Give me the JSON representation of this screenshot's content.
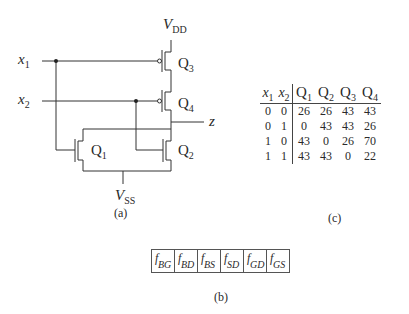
{
  "circuit": {
    "supply_top": {
      "main": "V",
      "sub": "DD"
    },
    "supply_bottom": {
      "main": "V",
      "sub": "SS"
    },
    "inputs": [
      {
        "main": "x",
        "sub": "1"
      },
      {
        "main": "x",
        "sub": "2"
      }
    ],
    "output": "z",
    "transistors": [
      {
        "main": "Q",
        "sub": "1",
        "type": "nMOS"
      },
      {
        "main": "Q",
        "sub": "2",
        "type": "nMOS"
      },
      {
        "main": "Q",
        "sub": "3",
        "type": "pMOS"
      },
      {
        "main": "Q",
        "sub": "4",
        "type": "pMOS"
      }
    ],
    "caption": "(a)"
  },
  "fault_vector": {
    "cells": [
      {
        "main": "f",
        "sub": "BG"
      },
      {
        "main": "f",
        "sub": "BD"
      },
      {
        "main": "f",
        "sub": "BS"
      },
      {
        "main": "f",
        "sub": "SD"
      },
      {
        "main": "f",
        "sub": "GD"
      },
      {
        "main": "f",
        "sub": "GS"
      }
    ],
    "caption": "(b)"
  },
  "table": {
    "headers": [
      {
        "main": "x",
        "sub": "1"
      },
      {
        "main": "x",
        "sub": "2"
      },
      {
        "main": "Q",
        "sub": "1"
      },
      {
        "main": "Q",
        "sub": "2"
      },
      {
        "main": "Q",
        "sub": "3"
      },
      {
        "main": "Q",
        "sub": "4"
      }
    ],
    "rows": [
      [
        "0",
        "0",
        "26",
        "26",
        "43",
        "43"
      ],
      [
        "0",
        "1",
        "0",
        "43",
        "43",
        "26"
      ],
      [
        "1",
        "0",
        "43",
        "0",
        "26",
        "70"
      ],
      [
        "1",
        "1",
        "43",
        "43",
        "0",
        "22"
      ]
    ],
    "caption": "(c)"
  }
}
